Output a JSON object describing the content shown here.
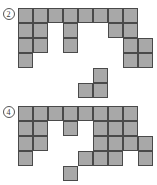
{
  "page": {
    "background_color": "#ffffff",
    "cell_fill_color": "#a8a8a8",
    "cell_border_color": "#4a4a4a",
    "cell_size_px": 15
  },
  "figures": [
    {
      "id": "figure-2",
      "label": "2",
      "label_style": "circled-number",
      "origin": {
        "x": 18,
        "y": 8
      },
      "cells": [
        {
          "col": 0,
          "row": 0
        },
        {
          "col": 1,
          "row": 0
        },
        {
          "col": 2,
          "row": 0
        },
        {
          "col": 3,
          "row": 0
        },
        {
          "col": 4,
          "row": 0
        },
        {
          "col": 5,
          "row": 0
        },
        {
          "col": 6,
          "row": 0
        },
        {
          "col": 7,
          "row": 0
        },
        {
          "col": 0,
          "row": 1
        },
        {
          "col": 1,
          "row": 1
        },
        {
          "col": 3,
          "row": 1
        },
        {
          "col": 6,
          "row": 1
        },
        {
          "col": 7,
          "row": 1
        },
        {
          "col": 0,
          "row": 2
        },
        {
          "col": 1,
          "row": 2
        },
        {
          "col": 3,
          "row": 2
        },
        {
          "col": 7,
          "row": 2
        },
        {
          "col": 8,
          "row": 2
        },
        {
          "col": 0,
          "row": 3
        },
        {
          "col": 7,
          "row": 3
        },
        {
          "col": 8,
          "row": 3
        },
        {
          "col": 5,
          "row": 4
        },
        {
          "col": 4,
          "row": 5
        },
        {
          "col": 5,
          "row": 5
        }
      ]
    },
    {
      "id": "figure-4",
      "label": "4",
      "label_style": "circled-number",
      "origin": {
        "x": 18,
        "y": 14
      },
      "cells": [
        {
          "col": 0,
          "row": 0
        },
        {
          "col": 1,
          "row": 0
        },
        {
          "col": 2,
          "row": 0
        },
        {
          "col": 3,
          "row": 0
        },
        {
          "col": 4,
          "row": 0
        },
        {
          "col": 5,
          "row": 0
        },
        {
          "col": 6,
          "row": 0
        },
        {
          "col": 7,
          "row": 0
        },
        {
          "col": 0,
          "row": 1
        },
        {
          "col": 1,
          "row": 1
        },
        {
          "col": 3,
          "row": 1
        },
        {
          "col": 5,
          "row": 1
        },
        {
          "col": 6,
          "row": 1
        },
        {
          "col": 7,
          "row": 1
        },
        {
          "col": 0,
          "row": 2
        },
        {
          "col": 1,
          "row": 2
        },
        {
          "col": 5,
          "row": 2
        },
        {
          "col": 6,
          "row": 2
        },
        {
          "col": 7,
          "row": 2
        },
        {
          "col": 8,
          "row": 2
        },
        {
          "col": 0,
          "row": 3
        },
        {
          "col": 4,
          "row": 3
        },
        {
          "col": 5,
          "row": 3
        },
        {
          "col": 6,
          "row": 3
        },
        {
          "col": 8,
          "row": 3
        },
        {
          "col": 3,
          "row": 4
        }
      ]
    }
  ]
}
